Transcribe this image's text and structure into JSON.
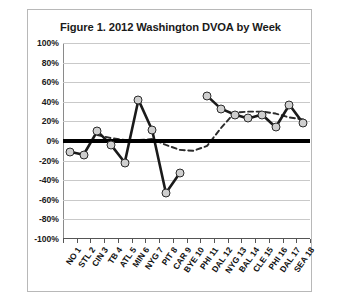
{
  "figure": {
    "title": "Figure 1. 2012 Washington DVOA by Week"
  },
  "chart_data": {
    "type": "line",
    "title": "Figure 1. 2012 Washington DVOA by Week",
    "xlabel": "",
    "ylabel": "",
    "ylim": [
      -100,
      100
    ],
    "ytick_values": [
      100,
      80,
      60,
      40,
      20,
      0,
      -20,
      -40,
      -60,
      -80,
      -100
    ],
    "ytick_labels": [
      "100%",
      "80%",
      "60%",
      "40%",
      "20%",
      "0%",
      "-20%",
      "-40%",
      "-60%",
      "-80%",
      "-100%"
    ],
    "grid": true,
    "legend": "none",
    "categories": [
      "NO 1",
      "STL 2",
      "CIN 3",
      "TB 4",
      "ATL 5",
      "MIN 6",
      "NYG 7",
      "PIT 8",
      "CAR 9",
      "BYE 10",
      "PHI 11",
      "DAL 12",
      "NYG 13",
      "BAL 14",
      "CLE 15",
      "PHI 16",
      "DAL 17",
      "SEA 18"
    ],
    "series": [
      {
        "name": "Weekly DVOA",
        "style": "solid-with-markers",
        "color": "#1a1a1a",
        "marker_fill": "#cfcfcf",
        "values": [
          -11,
          -14,
          10,
          -4,
          -22,
          42,
          11,
          -53,
          -33,
          null,
          46,
          33,
          27,
          23,
          27,
          14,
          37,
          18
        ]
      },
      {
        "name": "Trend",
        "style": "dashed-no-markers",
        "color": "#2b2b2b",
        "values": [
          null,
          null,
          6,
          3,
          1,
          1,
          2,
          -4,
          -9,
          -10,
          -5,
          13,
          29,
          30,
          30,
          28,
          24,
          22
        ]
      }
    ],
    "annotations": [
      {
        "name": "zero-reference-line",
        "value": 0,
        "style": "thick-solid-black"
      }
    ]
  }
}
